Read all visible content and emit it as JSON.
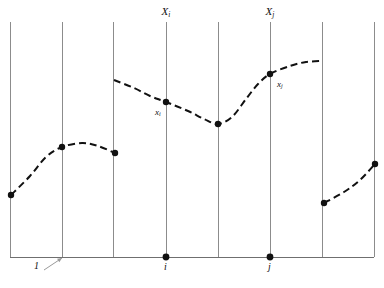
{
  "figure": {
    "background_color": "#ffffff",
    "width": 384,
    "height": 288
  },
  "colors": {
    "grid_line": "#8c8c8c",
    "baseline": "#6f6f6f",
    "curve": "#111111",
    "marker": "#111111",
    "label_text": "#111111",
    "leader_line": "#9a9a9a"
  },
  "axes": {
    "baseline_y": 257,
    "grid_top_y": 22,
    "grid_bottom_y": 257,
    "grid_x_positions": [
      10,
      62,
      113,
      166,
      218,
      270,
      322,
      374
    ],
    "grid_line_width": 1,
    "baseline_line_width": 1
  },
  "labels": {
    "top": [
      {
        "name": "X-sub-i",
        "base": "X",
        "sub": "i",
        "x": 166,
        "y": 6
      },
      {
        "name": "X-sub-j",
        "base": "X",
        "sub": "j",
        "x": 270,
        "y": 6
      }
    ],
    "curve": [
      {
        "name": "x-sub-i",
        "base": "x",
        "sub": "i",
        "x": 155,
        "y": 108
      },
      {
        "name": "x-sub-j",
        "base": "x",
        "sub": "j",
        "x": 277,
        "y": 80
      }
    ],
    "bottom": [
      {
        "name": "i",
        "text": "i",
        "x": 164,
        "y": 262
      },
      {
        "name": "j",
        "text": "j",
        "x": 268,
        "y": 262
      },
      {
        "name": "1",
        "text": "1",
        "x": 34,
        "y": 261
      }
    ]
  },
  "leader": {
    "name": "callout-leader-line",
    "from_x": 44,
    "from_y": 270,
    "to_x": 62,
    "to_y": 258,
    "arrow": true
  },
  "chart_data": {
    "type": "line",
    "xlabel": "",
    "ylabel": "",
    "grid": "vertical-only",
    "legend": "none",
    "line_style": "dashed",
    "xlim": [
      0,
      384
    ],
    "ylim": [
      288,
      0
    ],
    "note": "y values are in screen pixel coordinates (smaller y = higher on the figure)",
    "gridlines_x": [
      10,
      62,
      113,
      166,
      218,
      270,
      322,
      374
    ],
    "series": [
      {
        "name": "segment-1",
        "points": [
          {
            "x": 11,
            "y": 195
          },
          {
            "x": 30,
            "y": 176
          },
          {
            "x": 46,
            "y": 157
          },
          {
            "x": 62,
            "y": 147
          },
          {
            "x": 82,
            "y": 143
          },
          {
            "x": 98,
            "y": 146
          },
          {
            "x": 115,
            "y": 153
          }
        ],
        "markers": [
          {
            "x": 11,
            "y": 195,
            "label": ""
          },
          {
            "x": 62,
            "y": 147,
            "label": ""
          },
          {
            "x": 115,
            "y": 153,
            "label": ""
          }
        ]
      },
      {
        "name": "segment-2",
        "points": [
          {
            "x": 114,
            "y": 80
          },
          {
            "x": 134,
            "y": 88
          },
          {
            "x": 150,
            "y": 96
          },
          {
            "x": 166,
            "y": 102
          },
          {
            "x": 188,
            "y": 111
          },
          {
            "x": 204,
            "y": 119
          },
          {
            "x": 218,
            "y": 124
          },
          {
            "x": 232,
            "y": 117
          },
          {
            "x": 246,
            "y": 99
          },
          {
            "x": 258,
            "y": 84
          },
          {
            "x": 270,
            "y": 74
          },
          {
            "x": 290,
            "y": 66
          },
          {
            "x": 306,
            "y": 62
          },
          {
            "x": 322,
            "y": 61
          }
        ],
        "markers": [
          {
            "x": 166,
            "y": 102,
            "label": "x_i"
          },
          {
            "x": 218,
            "y": 124,
            "label": ""
          },
          {
            "x": 270,
            "y": 74,
            "label": "x_j"
          }
        ]
      },
      {
        "name": "segment-3",
        "points": [
          {
            "x": 324,
            "y": 203
          },
          {
            "x": 344,
            "y": 192
          },
          {
            "x": 360,
            "y": 180
          },
          {
            "x": 375,
            "y": 164
          }
        ],
        "markers": [
          {
            "x": 324,
            "y": 203,
            "label": ""
          },
          {
            "x": 375,
            "y": 164,
            "label": ""
          }
        ]
      }
    ],
    "baseline_markers": [
      {
        "x": 166,
        "y": 257,
        "label": "i"
      },
      {
        "x": 270,
        "y": 257,
        "label": "j"
      }
    ],
    "annotations": [
      {
        "text": "X_i",
        "x": 166,
        "y": 12,
        "position": "top"
      },
      {
        "text": "X_j",
        "x": 270,
        "y": 12,
        "position": "top"
      },
      {
        "text": "x_i",
        "x": 158,
        "y": 112,
        "position": "below-left-of-point"
      },
      {
        "text": "x_j",
        "x": 280,
        "y": 84,
        "position": "below-right-of-point"
      },
      {
        "text": "i",
        "x": 166,
        "y": 268,
        "position": "below-baseline"
      },
      {
        "text": "j",
        "x": 270,
        "y": 268,
        "position": "below-baseline"
      },
      {
        "text": "1",
        "x": 36,
        "y": 268,
        "position": "below-baseline-with-leader"
      }
    ]
  }
}
